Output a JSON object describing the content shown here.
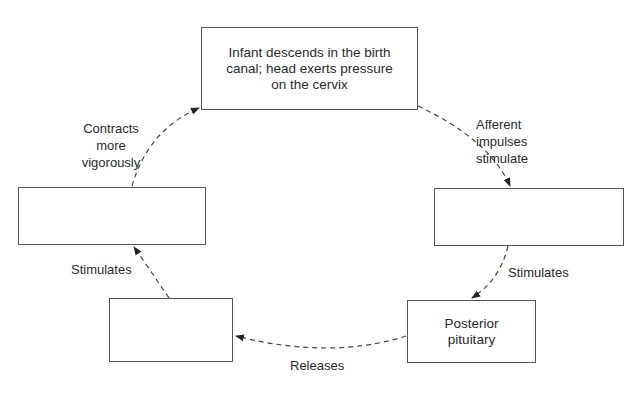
{
  "diagram": {
    "type": "cycle",
    "nodes": [
      {
        "id": "top",
        "text": "Infant descends in the birth canal; head exerts pressure on the cervix"
      },
      {
        "id": "right",
        "text": ""
      },
      {
        "id": "bottom_right",
        "text": "Posterior pituitary"
      },
      {
        "id": "bottom_left",
        "text": ""
      },
      {
        "id": "left",
        "text": ""
      }
    ],
    "edges": [
      {
        "from": "top",
        "to": "right",
        "label": "Afferent\nimpulses\nstimulate"
      },
      {
        "from": "right",
        "to": "bottom_right",
        "label": "Stimulates"
      },
      {
        "from": "bottom_right",
        "to": "bottom_left",
        "label": "Releases"
      },
      {
        "from": "bottom_left",
        "to": "left",
        "label": "Stimulates"
      },
      {
        "from": "left",
        "to": "top",
        "label": "Contracts\nmore\nvigorously"
      }
    ],
    "line_style": "dashed",
    "colors": {
      "stroke": "#555555",
      "text": "#2a2a2a",
      "background": "#ffffff"
    }
  }
}
